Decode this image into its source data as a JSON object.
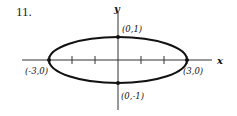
{
  "problem_number": "11.",
  "axes": {
    "x_label": "x",
    "y_label": "y"
  },
  "ellipse": {
    "semi_major_x": 3,
    "semi_minor_y": 1,
    "center": [
      0,
      0
    ]
  },
  "x_ticks": [
    -3,
    -2,
    -1,
    1,
    2,
    3
  ],
  "points": [
    {
      "label": "(0,1)",
      "x": 0,
      "y": 1
    },
    {
      "label": "(0,-1)",
      "x": 0,
      "y": -1
    },
    {
      "label": "(-3,0)",
      "x": -3,
      "y": 0
    },
    {
      "label": "(3,0)",
      "x": 3,
      "y": 0
    }
  ],
  "colors": {
    "ink": "#111111"
  }
}
